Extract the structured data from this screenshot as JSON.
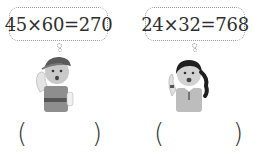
{
  "items": [
    {
      "speaker": "boy",
      "equation": "45×60=270",
      "answer_open": "(",
      "answer_close": ")"
    },
    {
      "speaker": "girl",
      "equation": "24×32=768",
      "answer_open": "(",
      "answer_close": ")"
    }
  ],
  "colors": {
    "bubble_border": "#9a9a9a",
    "figure_gray": "#8c8c8c"
  }
}
